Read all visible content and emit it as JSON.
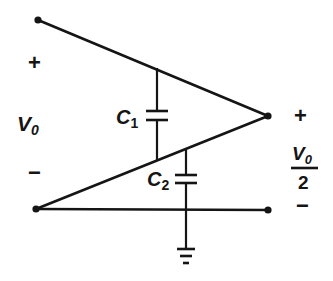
{
  "diagram": {
    "type": "capacitive voltage divider circuit",
    "colors": {
      "ink": "#151515",
      "background": "#ffffff"
    },
    "input": {
      "label": "V",
      "label_sub": "0",
      "plus": "+",
      "minus": "−"
    },
    "output": {
      "numerator": "V",
      "numerator_sub": "0",
      "denominator": "2",
      "plus": "+",
      "minus": "−"
    },
    "components": [
      {
        "id": "C1",
        "label": "C",
        "sub": "1",
        "type": "capacitor"
      },
      {
        "id": "C2",
        "label": "C",
        "sub": "2",
        "type": "capacitor"
      },
      {
        "id": "GND",
        "type": "ground"
      }
    ],
    "nodes": [
      {
        "id": "in_top",
        "x": 38,
        "y": 20
      },
      {
        "id": "in_bottom",
        "x": 36,
        "y": 209
      },
      {
        "id": "out_top",
        "x": 268,
        "y": 116
      },
      {
        "id": "out_bottom",
        "x": 268,
        "y": 210
      }
    ]
  }
}
